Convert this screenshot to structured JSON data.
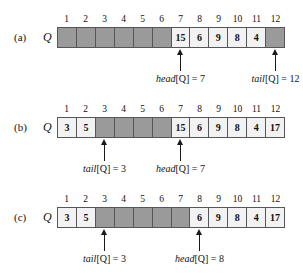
{
  "figure": {
    "array_name": "Q",
    "indices": [
      "1",
      "2",
      "3",
      "4",
      "5",
      "6",
      "7",
      "8",
      "9",
      "10",
      "11",
      "12"
    ],
    "colors": {
      "shaded_cell": "#9a9a9a",
      "value_cell": "#f2f2f2",
      "border": "#55555a",
      "arrow": "#1a1a1a",
      "text": "#111111"
    }
  },
  "panels": [
    {
      "label": "(a)",
      "array_name": "Q",
      "cells": [
        {
          "index": "1",
          "value": "",
          "shaded": true
        },
        {
          "index": "2",
          "value": "",
          "shaded": true
        },
        {
          "index": "3",
          "value": "",
          "shaded": true
        },
        {
          "index": "4",
          "value": "",
          "shaded": true
        },
        {
          "index": "5",
          "value": "",
          "shaded": true
        },
        {
          "index": "6",
          "value": "",
          "shaded": true
        },
        {
          "index": "7",
          "value": "15",
          "shaded": false
        },
        {
          "index": "8",
          "value": "6",
          "shaded": false
        },
        {
          "index": "9",
          "value": "9",
          "shaded": false
        },
        {
          "index": "10",
          "value": "8",
          "shaded": false
        },
        {
          "index": "11",
          "value": "4",
          "shaded": false
        },
        {
          "index": "12",
          "value": "",
          "shaded": true
        }
      ],
      "pointers": [
        {
          "name": "head",
          "caption_fn": "head",
          "caption_arg": "[Q] = 7",
          "cell": 7,
          "value": "7"
        },
        {
          "name": "tail",
          "caption_fn": "tail",
          "caption_arg": "[Q] = 12",
          "cell": 12,
          "value": "12"
        }
      ]
    },
    {
      "label": "(b)",
      "array_name": "Q",
      "cells": [
        {
          "index": "1",
          "value": "3",
          "shaded": false
        },
        {
          "index": "2",
          "value": "5",
          "shaded": false
        },
        {
          "index": "3",
          "value": "",
          "shaded": true
        },
        {
          "index": "4",
          "value": "",
          "shaded": true
        },
        {
          "index": "5",
          "value": "",
          "shaded": true
        },
        {
          "index": "6",
          "value": "",
          "shaded": true
        },
        {
          "index": "7",
          "value": "15",
          "shaded": false
        },
        {
          "index": "8",
          "value": "6",
          "shaded": false
        },
        {
          "index": "9",
          "value": "9",
          "shaded": false
        },
        {
          "index": "10",
          "value": "8",
          "shaded": false
        },
        {
          "index": "11",
          "value": "4",
          "shaded": false
        },
        {
          "index": "12",
          "value": "17",
          "shaded": false
        }
      ],
      "pointers": [
        {
          "name": "tail",
          "caption_fn": "tail",
          "caption_arg": "[Q] = 3",
          "cell": 3,
          "value": "3"
        },
        {
          "name": "head",
          "caption_fn": "head",
          "caption_arg": "[Q] = 7",
          "cell": 7,
          "value": "7"
        }
      ]
    },
    {
      "label": "(c)",
      "array_name": "Q",
      "cells": [
        {
          "index": "1",
          "value": "3",
          "shaded": false
        },
        {
          "index": "2",
          "value": "5",
          "shaded": false
        },
        {
          "index": "3",
          "value": "",
          "shaded": true
        },
        {
          "index": "4",
          "value": "",
          "shaded": true
        },
        {
          "index": "5",
          "value": "",
          "shaded": true
        },
        {
          "index": "6",
          "value": "",
          "shaded": true
        },
        {
          "index": "7",
          "value": "15",
          "shaded": true
        },
        {
          "index": "8",
          "value": "6",
          "shaded": false
        },
        {
          "index": "9",
          "value": "9",
          "shaded": false
        },
        {
          "index": "10",
          "value": "8",
          "shaded": false
        },
        {
          "index": "11",
          "value": "4",
          "shaded": false
        },
        {
          "index": "12",
          "value": "17",
          "shaded": false
        }
      ],
      "pointers": [
        {
          "name": "tail",
          "caption_fn": "tail",
          "caption_arg": "[Q] = 3",
          "cell": 3,
          "value": "3"
        },
        {
          "name": "head",
          "caption_fn": "head",
          "caption_arg": "[Q] = 8",
          "cell": 8,
          "value": "8"
        }
      ]
    }
  ]
}
